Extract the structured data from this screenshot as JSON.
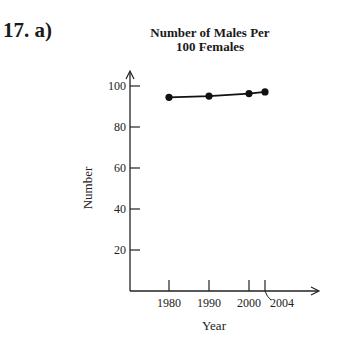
{
  "problem_label": "17. a)",
  "chart_data": {
    "type": "line",
    "title": "Number of Males Per 100 Females",
    "title_lines": [
      "Number of Males Per",
      "100 Females"
    ],
    "xlabel": "Year",
    "ylabel": "Number",
    "x": [
      1980,
      1990,
      2000,
      2004
    ],
    "x_tick_labels": [
      "1980",
      "1990",
      "2000",
      "2004"
    ],
    "y_ticks": [
      20,
      40,
      60,
      80,
      100
    ],
    "y_tick_labels": [
      "20",
      "40",
      "60",
      "80",
      "100"
    ],
    "series": [
      {
        "name": "Males per 100 females",
        "values": [
          94.5,
          95.1,
          96.3,
          97.1
        ]
      }
    ],
    "ylim": [
      0,
      100
    ],
    "grid": false,
    "legend": "none",
    "annotations": [
      "x-axis break (squiggle) before 2004"
    ]
  }
}
